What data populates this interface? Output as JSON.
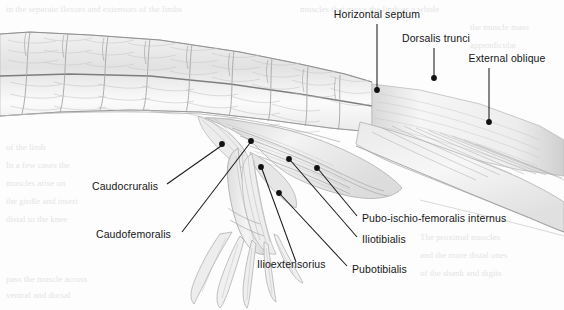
{
  "figure": {
    "medium": "pencil drawing",
    "background_color": "#fdfdfd",
    "ink_color": "#161616",
    "leader_color": "#1a1a1a"
  },
  "labels": [
    {
      "id": "horizontal-septum",
      "text": "Horizontal septum",
      "text_x": 377,
      "text_y": 18,
      "anchor": "middle",
      "dot_x": 377,
      "dot_y": 90,
      "line_x1": 377,
      "line_y1": 24,
      "line_x2": 377,
      "line_y2": 89
    },
    {
      "id": "dorsalis-trunci",
      "text": "Dorsalis trunci",
      "text_x": 436,
      "text_y": 42,
      "anchor": "middle",
      "dot_x": 434,
      "dot_y": 78,
      "line_x1": 434,
      "line_y1": 48,
      "line_x2": 434,
      "line_y2": 77
    },
    {
      "id": "external-oblique",
      "text": "External oblique",
      "text_x": 507,
      "text_y": 62,
      "anchor": "middle",
      "dot_x": 489,
      "dot_y": 122,
      "line_x1": 489,
      "line_y1": 68,
      "line_x2": 489,
      "line_y2": 121
    },
    {
      "id": "caudocruralis",
      "text": "Caudocruralis",
      "text_x": 92,
      "text_y": 190,
      "anchor": "start",
      "dot_x": 222,
      "dot_y": 144,
      "line_x1": 167,
      "line_y1": 184,
      "line_x2": 221,
      "line_y2": 146
    },
    {
      "id": "caudofemoralis",
      "text": "Caudofemoralis",
      "text_x": 96,
      "text_y": 238,
      "anchor": "start",
      "dot_x": 251,
      "dot_y": 141,
      "line_x1": 182,
      "line_y1": 232,
      "line_x2": 250,
      "line_y2": 143
    },
    {
      "id": "ilioextensorius",
      "text": "Ilioextensorius",
      "text_x": 257,
      "text_y": 268,
      "anchor": "start",
      "dot_x": 261,
      "dot_y": 167,
      "line_x1": 296,
      "line_y1": 262,
      "line_x2": 262,
      "line_y2": 169
    },
    {
      "id": "pubotibialis",
      "text": "Pubotibialis",
      "text_x": 352,
      "text_y": 273,
      "anchor": "start",
      "dot_x": 279,
      "dot_y": 193,
      "line_x1": 347,
      "line_y1": 266,
      "line_x2": 281,
      "line_y2": 195
    },
    {
      "id": "iliotibialis",
      "text": "Iliotibialis",
      "text_x": 362,
      "text_y": 243,
      "anchor": "start",
      "dot_x": 289,
      "dot_y": 159,
      "line_x1": 357,
      "line_y1": 237,
      "line_x2": 291,
      "line_y2": 161
    },
    {
      "id": "pubo-ischio-femoralis-internus",
      "text": "Pubo-ischio-femoralis internus",
      "text_x": 362,
      "text_y": 222,
      "anchor": "start",
      "dot_x": 317,
      "dot_y": 168,
      "line_x1": 357,
      "line_y1": 216,
      "line_x2": 319,
      "line_y2": 170
    }
  ],
  "bleed_through": [
    {
      "text": "in the separate flexors and extensors of the limbs",
      "x": 6,
      "y": 12
    },
    {
      "text": "muscles that move the limb as a whole",
      "x": 300,
      "y": 12
    },
    {
      "text": "the muscle mass",
      "x": 470,
      "y": 30
    },
    {
      "text": "appendicular",
      "x": 470,
      "y": 48
    },
    {
      "text": "of the limb",
      "x": 6,
      "y": 150
    },
    {
      "text": "In a few cases the",
      "x": 6,
      "y": 168
    },
    {
      "text": "muscles arise on",
      "x": 6,
      "y": 186
    },
    {
      "text": "the girdle and insert",
      "x": 6,
      "y": 204
    },
    {
      "text": "distal to the knee",
      "x": 6,
      "y": 222
    },
    {
      "text": "The proximal muscles",
      "x": 420,
      "y": 240
    },
    {
      "text": "and the more distal ones",
      "x": 420,
      "y": 258
    },
    {
      "text": "of the shank and digits",
      "x": 420,
      "y": 276
    },
    {
      "text": "pass the muscle across",
      "x": 6,
      "y": 282
    },
    {
      "text": "ventral and dorsal",
      "x": 6,
      "y": 298
    }
  ]
}
